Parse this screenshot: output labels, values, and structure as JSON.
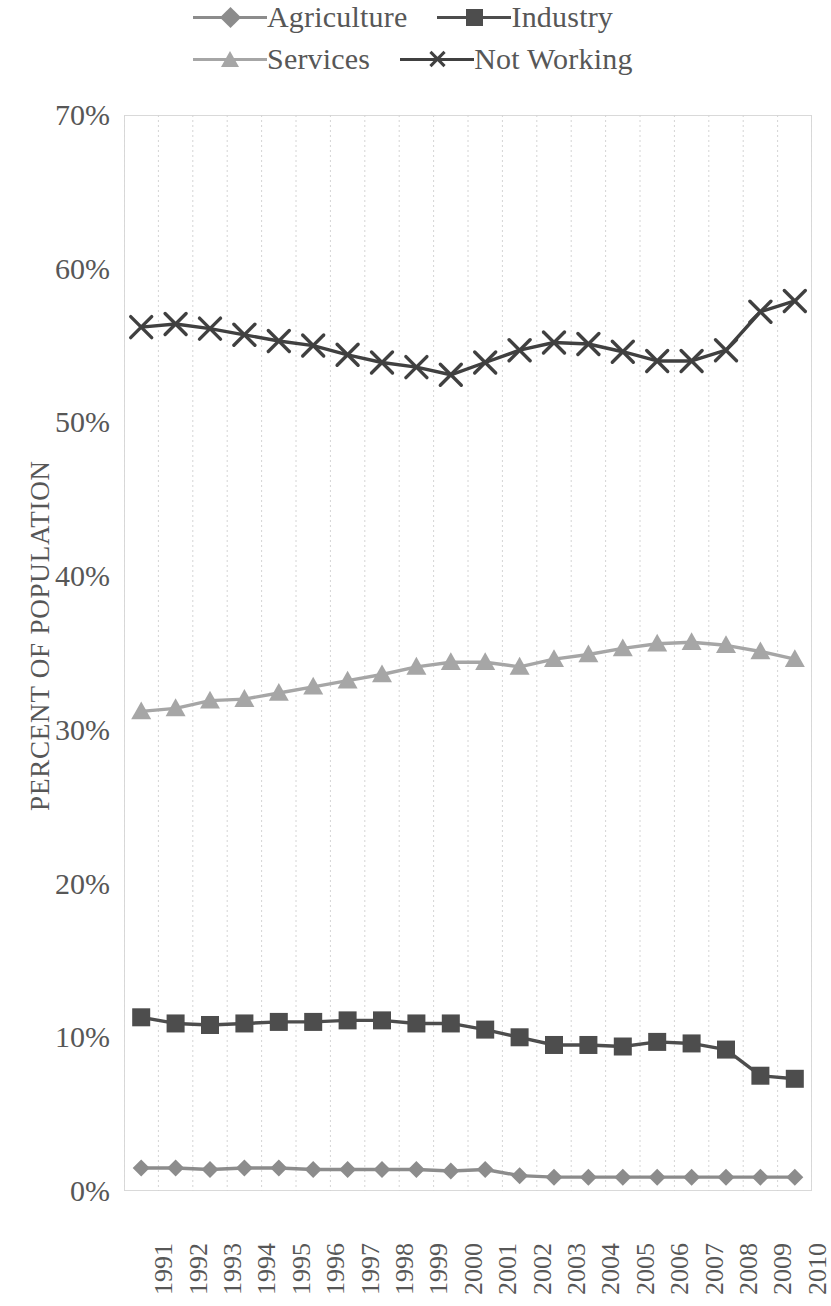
{
  "legend": {
    "entries": [
      {
        "label": "Agriculture",
        "marker": "diamond-marker",
        "color": "#8c8c8c"
      },
      {
        "label": "Industry",
        "marker": "square-marker",
        "color": "#4d4d4d"
      },
      {
        "label": "Services",
        "marker": "triangle-marker",
        "color": "#a6a6a6"
      },
      {
        "label": "Not Working",
        "marker": "x-marker",
        "color": "#404040"
      }
    ]
  },
  "axes": {
    "ylabel": "PERCENT OF POPULATION",
    "yticks": [
      "0%",
      "10%",
      "20%",
      "30%",
      "40%",
      "50%",
      "60%",
      "70%"
    ],
    "xticks": [
      "1991",
      "1992",
      "1993",
      "1994",
      "1995",
      "1996",
      "1997",
      "1998",
      "1999",
      "2000",
      "2001",
      "2002",
      "2003",
      "2004",
      "2005",
      "2006",
      "2007",
      "2008",
      "2009",
      "2010"
    ]
  },
  "chart_data": {
    "type": "line",
    "title": "",
    "xlabel": "",
    "ylabel": "PERCENT OF POPULATION",
    "ylim": [
      0,
      70
    ],
    "ytick_step": 10,
    "ytick_format": "percent",
    "grid": {
      "vertical": true,
      "horizontal": false,
      "style": "dotted"
    },
    "legend_position": "top",
    "x": [
      "1991",
      "1992",
      "1993",
      "1994",
      "1995",
      "1996",
      "1997",
      "1998",
      "1999",
      "2000",
      "2001",
      "2002",
      "2003",
      "2004",
      "2005",
      "2006",
      "2007",
      "2008",
      "2009",
      "2010"
    ],
    "series": [
      {
        "name": "Agriculture",
        "marker": "diamond",
        "color": "#8c8c8c",
        "values": [
          1.5,
          1.5,
          1.4,
          1.5,
          1.5,
          1.4,
          1.4,
          1.4,
          1.4,
          1.3,
          1.4,
          1.0,
          0.9,
          0.9,
          0.9,
          0.9,
          0.9,
          0.9,
          0.9,
          0.9
        ]
      },
      {
        "name": "Industry",
        "marker": "square",
        "color": "#4d4d4d",
        "values": [
          11.3,
          10.9,
          10.8,
          10.9,
          11.0,
          11.0,
          11.1,
          11.1,
          10.9,
          10.9,
          10.5,
          10.0,
          9.5,
          9.5,
          9.4,
          9.7,
          9.6,
          9.2,
          7.5,
          7.3
        ]
      },
      {
        "name": "Services",
        "marker": "triangle",
        "color": "#a6a6a6",
        "values": [
          31.2,
          31.4,
          31.9,
          32.0,
          32.4,
          32.8,
          33.2,
          33.6,
          34.1,
          34.4,
          34.4,
          34.1,
          34.6,
          34.9,
          35.3,
          35.6,
          35.7,
          35.5,
          35.1,
          34.6
        ]
      },
      {
        "name": "Not Working",
        "marker": "x",
        "color": "#404040",
        "values": [
          56.2,
          56.4,
          56.1,
          55.7,
          55.3,
          55.0,
          54.4,
          53.9,
          53.6,
          53.1,
          53.9,
          54.7,
          55.2,
          55.1,
          54.6,
          54.0,
          54.0,
          54.7,
          57.2,
          57.9
        ]
      }
    ]
  }
}
